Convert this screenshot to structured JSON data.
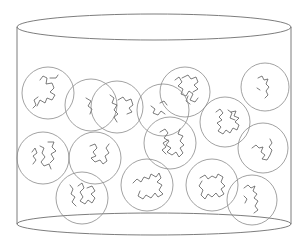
{
  "diagram": {
    "colors": {
      "background": "#ffffff",
      "outline": "#6e6e6e",
      "coil": "#8a8a8a",
      "chain": "#5a5a5a"
    },
    "container": {
      "type": "cylinder",
      "left_x": 17,
      "right_x": 291,
      "top_ellipse": {
        "cx": 154,
        "cy": 27,
        "rx": 137,
        "ry": 13
      },
      "bottom_ellipse": {
        "cx": 154,
        "cy": 224,
        "rx": 137,
        "ry": 11
      }
    },
    "coil_count": 16,
    "coils": [
      {
        "id": 1,
        "cx": 48,
        "cy": 93,
        "r": 26,
        "chain": "M40,80 l3,-4 l4,2 l-1,6 l6,-1 l2,5 l-4,4 l5,3 l-3,5 l-5,-2 l-2,5 l-5,-3 l-3,6 M38,97 l-4,3 l2,5 l-3,3 M50,78 l6,0 l2,-3"
      },
      {
        "id": 2,
        "cx": 91,
        "cy": 105,
        "r": 26,
        "chain": "M86,98 l5,3 l-3,5 l4,3 l-2,5"
      },
      {
        "id": 3,
        "cx": 117,
        "cy": 107,
        "r": 26,
        "chain": "M110,95 l4,3 l-2,5 l5,2 l-3,5 l4,4 l-4,3 l3,5 M118,100 l5,-3 l3,4 l5,-2 l2,6 l-4,3 l3,4 l-5,2"
      },
      {
        "id": 4,
        "cx": 185,
        "cy": 92,
        "r": 25,
        "chain": "M175,80 l4,-3 l3,5 l-4,4 l5,3 l-2,5 l5,2 l3,-5 l4,3 l-3,6 l5,2 l3,-4 M182,78 l6,-3 l3,4 l5,-2 l2,5 l-4,3 l4,4 l-5,3 M188,96 l-2,5 l4,3"
      },
      {
        "id": 5,
        "cx": 265,
        "cy": 87,
        "r": 24,
        "chain": "M258,78 l4,-2 l2,4 l4,-1 l-2,5 l3,3 l-3,4 l2,4 l-3,3 M257,88 l3,2"
      },
      {
        "id": 6,
        "cx": 163,
        "cy": 110,
        "r": 26,
        "chain": "M151,106 l4,3 l-2,4 l5,2 l3,-4 l4,3 M160,103 l4,-2 l3,4"
      },
      {
        "id": 7,
        "cx": 225,
        "cy": 122,
        "r": 25,
        "chain": "M216,112 l4,-3 l3,4 l-4,4 l3,3 l-5,3 l4,4 l-3,4 l5,3 l3,-4 l4,3 l3,-5 l4,2 l2,-5 l-4,-3 l4,-4 l-5,-2 l2,-5 l-5,1 M228,110 l4,3 l-2,5 l5,2"
      },
      {
        "id": 8,
        "cx": 170,
        "cy": 143,
        "r": 26,
        "chain": "M160,132 l5,-3 l3,4 l-4,5 l5,3 l-3,4 l5,3 l-4,4 l5,3 l4,-3 l3,5 l4,-4 l-3,-5 l4,-3 l-4,-4 l3,-5 l-5,-2 l2,-5 M168,140 l-5,3 l3,4 l-4,3 l4,4"
      },
      {
        "id": 9,
        "cx": 263,
        "cy": 148,
        "r": 25,
        "chain": "M252,148 l4,-3 l3,3 l4,-1 l-2,5 l4,3 l-3,4 l5,1 l3,-5 l2,-5 l-3,-3 l3,-4 l-2,-4"
      },
      {
        "id": 10,
        "cx": 43,
        "cy": 158,
        "r": 26,
        "chain": "M32,152 l3,-4 l2,5 l-4,3 l3,4 l-3,4 M40,146 l4,2 l-2,5 l3,4 l-4,5 l3,4 l5,-2 l2,5 M48,142 l6,0 l-2,5 l4,4 l-5,3 l3,5 l-4,4"
      },
      {
        "id": 11,
        "cx": 95,
        "cy": 158,
        "r": 26,
        "chain": "M90,146 l5,-2 l2,4 l-4,4 l3,4 l-5,2 l4,4 l5,-2 l3,4 l4,-3 l-2,-5 l4,-3 l-3,-5 l3,-4"
      },
      {
        "id": 12,
        "cx": 82,
        "cy": 198,
        "r": 26,
        "chain": "M70,185 l3,4 l-2,5 l4,3 l-3,5 l4,4 M78,186 l4,-3 l2,5 l-4,4 l3,5 l-3,4 l5,3 l3,-4 l4,3 l3,-5 l-4,-4 l4,-3 l-3,-5 l-5,2"
      },
      {
        "id": 13,
        "cx": 147,
        "cy": 185,
        "r": 26,
        "chain": "M133,183 l4,-4 l4,3 l3,-5 l5,2 l2,-5 l5,3 l3,-4 l2,5 l-4,4 l5,3 l-3,5 l4,4 l-5,3 l-3,-4 l-4,5 l-5,-3 l-3,4 l-5,-3 l2,-5"
      },
      {
        "id": 14,
        "cx": 212,
        "cy": 185,
        "r": 26,
        "chain": "M200,178 l5,-3 l3,4 l4,-3 l4,2 l2,-4 l5,3 l-2,5 l4,4 l-4,3 l3,5 l-5,3 l-3,-4 l-4,4 l-4,-3 l-3,5 l-4,-4 l2,-5 l-4,-4 l3,-5"
      },
      {
        "id": 15,
        "cx": 252,
        "cy": 200,
        "r": 25,
        "chain": "M244,188 l4,-3 l3,3 l4,-2 l-2,5 l4,3 l-3,4 l4,3 l-3,5 l3,4 l-4,3 M244,196 l3,3 l-2,4"
      },
      {
        "id": 16,
        "cx": 175,
        "cy": 150,
        "r": 0,
        "chain": ""
      }
    ]
  }
}
